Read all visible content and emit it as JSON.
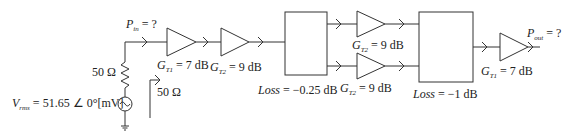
{
  "diagram": {
    "type": "rf-cascade-block-diagram",
    "source": {
      "voltage_symbol": "V",
      "voltage_subscript": "rms",
      "voltage_value": "= 51.65 ∠ 0°[mV]",
      "source_resistance": "50 Ω",
      "icon": "ac-voltage-source-icon"
    },
    "input_power": {
      "symbol": "P",
      "subscript": "in",
      "value": "= ?"
    },
    "input_impedance": "50 Ω",
    "stages": [
      {
        "id": "amp1",
        "kind": "amplifier",
        "symbol": "G",
        "subscript": "T1",
        "value": "= 7 dB"
      },
      {
        "id": "amp2",
        "kind": "amplifier",
        "symbol": "G",
        "subscript": "T2",
        "value": "= 9 dB"
      },
      {
        "id": "splitter",
        "kind": "block",
        "label_symbol": "Loss",
        "value": "= −0.25 dB"
      },
      {
        "id": "amp3-upper",
        "kind": "amplifier",
        "symbol": "G",
        "subscript": "T2",
        "value": "= 9 dB"
      },
      {
        "id": "amp3-lower",
        "kind": "amplifier",
        "symbol": "G",
        "subscript": "T2",
        "value": "= 9 dB"
      },
      {
        "id": "combiner",
        "kind": "block",
        "label_symbol": "Loss",
        "value": "= −1 dB"
      },
      {
        "id": "amp5",
        "kind": "amplifier",
        "symbol": "G",
        "subscript": "T1",
        "value": "= 7 dB"
      }
    ],
    "output_power": {
      "symbol": "P",
      "subscript": "out",
      "value": "= ?"
    },
    "colors": {
      "line": "#333333",
      "text": "#222222",
      "background": "#ffffff"
    }
  }
}
